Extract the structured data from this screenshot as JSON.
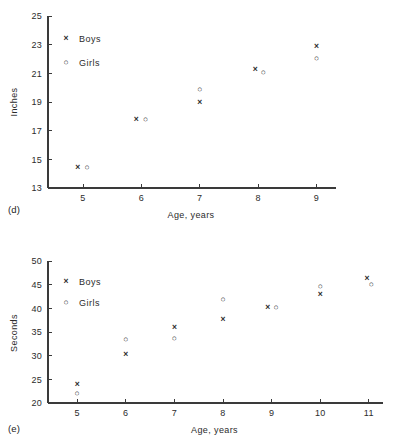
{
  "figure": {
    "panels": [
      {
        "label": "(d)",
        "chart_data": {
          "type": "scatter",
          "title": "",
          "xlabel": "Age, years",
          "ylabel": "Inches",
          "xlim": [
            4.4,
            9.3
          ],
          "ylim": [
            13,
            25
          ],
          "xticks": [
            5,
            6,
            7,
            8,
            9
          ],
          "yticks": [
            13,
            15,
            17,
            19,
            21,
            23,
            25
          ],
          "grid": false,
          "legend_position": "upper-left",
          "x": [
            5,
            6,
            7,
            8,
            9
          ],
          "series": [
            {
              "name": "Boys",
              "marker": "x",
              "values": [
                14.5,
                17.8,
                19.0,
                21.3,
                22.9
              ],
              "x_offsets": [
                -0.09,
                -0.09,
                0.0,
                -0.05,
                0.0
              ]
            },
            {
              "name": "Girls",
              "marker": "o",
              "values": [
                14.5,
                17.8,
                19.9,
                21.1,
                22.1
              ],
              "x_offsets": [
                0.07,
                0.07,
                0.0,
                0.09,
                0.0
              ]
            }
          ]
        }
      },
      {
        "label": "(e)",
        "chart_data": {
          "type": "scatter",
          "title": "",
          "xlabel": "Age, years",
          "ylabel": "Seconds",
          "xlim": [
            4.4,
            11.25
          ],
          "ylim": [
            20,
            50
          ],
          "xticks": [
            5,
            6,
            7,
            8,
            9,
            10,
            11
          ],
          "yticks": [
            20,
            25,
            30,
            35,
            40,
            45,
            50
          ],
          "grid": false,
          "legend_position": "upper-left",
          "x": [
            5,
            6,
            7,
            8,
            9,
            10,
            11
          ],
          "series": [
            {
              "name": "Boys",
              "marker": "x",
              "values": [
                24.0,
                30.3,
                36.0,
                37.8,
                40.3,
                43.0,
                46.5
              ],
              "x_offsets": [
                0.0,
                0.0,
                0.0,
                0.0,
                -0.08,
                0.0,
                -0.04
              ]
            },
            {
              "name": "Girls",
              "marker": "o",
              "values": [
                22.2,
                33.6,
                33.8,
                42.0,
                40.3,
                44.8,
                45.1
              ],
              "x_offsets": [
                0.0,
                0.0,
                0.0,
                0.0,
                0.09,
                0.0,
                0.05
              ]
            }
          ]
        }
      }
    ],
    "legend_items": [
      {
        "marker": "x",
        "label": "Boys"
      },
      {
        "marker": "o",
        "label": "Girls"
      }
    ],
    "colors": {
      "axis": "#3a3a3a",
      "text": "#2b2b2b",
      "marker": "#333333",
      "background": "#ffffff"
    }
  }
}
